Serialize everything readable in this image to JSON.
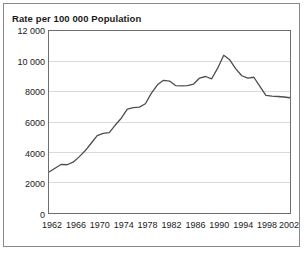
{
  "chart_data": {
    "type": "line",
    "title": "Rate per 100 000 Population",
    "xlabel": "",
    "ylabel": "",
    "xlim": [
      1962,
      2002
    ],
    "ylim": [
      0,
      12000
    ],
    "grid": true,
    "legend": false,
    "legend_position": "none",
    "ytick_labels": [
      "12 000",
      "10 000",
      "8000",
      "6000",
      "4000",
      "2000",
      "0"
    ],
    "ytick_values": [
      12000,
      10000,
      8000,
      6000,
      4000,
      2000,
      0
    ],
    "xtick_labels": [
      "1962",
      "1966",
      "1970",
      "1974",
      "1978",
      "1982",
      "1986",
      "1990",
      "1994",
      "1998",
      "2002"
    ],
    "xtick_values": [
      1962,
      1966,
      1970,
      1974,
      1978,
      1982,
      1986,
      1990,
      1994,
      1998,
      2002
    ],
    "series": [
      {
        "name": "Rate per 100 000 Population",
        "color": "#4d4d4d",
        "x": [
          1962,
          1963,
          1964,
          1965,
          1966,
          1967,
          1968,
          1969,
          1970,
          1971,
          1972,
          1973,
          1974,
          1975,
          1976,
          1977,
          1978,
          1979,
          1980,
          1981,
          1982,
          1983,
          1984,
          1985,
          1986,
          1987,
          1988,
          1989,
          1990,
          1991,
          1992,
          1993,
          1994,
          1995,
          1996,
          1997,
          1998,
          1999,
          2000,
          2001,
          2002
        ],
        "values": [
          2700,
          2950,
          3200,
          3180,
          3350,
          3700,
          4100,
          4600,
          5100,
          5250,
          5300,
          5800,
          6250,
          6850,
          6950,
          6980,
          7200,
          7900,
          8450,
          8750,
          8700,
          8400,
          8380,
          8400,
          8500,
          8900,
          9000,
          8850,
          9550,
          10400,
          10100,
          9500,
          9050,
          8900,
          8950,
          8350,
          7750,
          7700,
          7680,
          7650,
          7600
        ]
      }
    ]
  },
  "colors": {
    "line": "#4d4d4d",
    "grid": "#d9d9d9",
    "axis": "#6e6e6e",
    "border": "#8a8a8a",
    "text": "#1a1a1a",
    "background": "#ffffff"
  }
}
